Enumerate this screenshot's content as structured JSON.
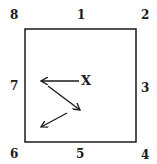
{
  "diagram": {
    "square": {
      "x": 25,
      "y": 29,
      "w": 111,
      "h": 113,
      "stroke": "#1a1a1a"
    },
    "labels": [
      {
        "id": "8",
        "text": "8",
        "x": 10,
        "y": 9
      },
      {
        "id": "1",
        "text": "1",
        "x": 77,
        "y": 9
      },
      {
        "id": "2",
        "text": "2",
        "x": 141,
        "y": 9
      },
      {
        "id": "7",
        "text": "7",
        "x": 10,
        "y": 80
      },
      {
        "id": "3",
        "text": "3",
        "x": 141,
        "y": 82
      },
      {
        "id": "6",
        "text": "6",
        "x": 10,
        "y": 148
      },
      {
        "id": "5",
        "text": "5",
        "x": 76,
        "y": 148
      },
      {
        "id": "4",
        "text": "4",
        "x": 141,
        "y": 149
      }
    ],
    "marker": {
      "text": "X",
      "x": 81,
      "y": 75
    },
    "arrows": [
      {
        "from": [
          79,
          81
        ],
        "to": [
          41,
          81
        ]
      },
      {
        "from": [
          48,
          86
        ],
        "to": [
          80,
          110
        ]
      },
      {
        "from": [
          67,
          113
        ],
        "to": [
          41,
          127
        ]
      }
    ]
  }
}
